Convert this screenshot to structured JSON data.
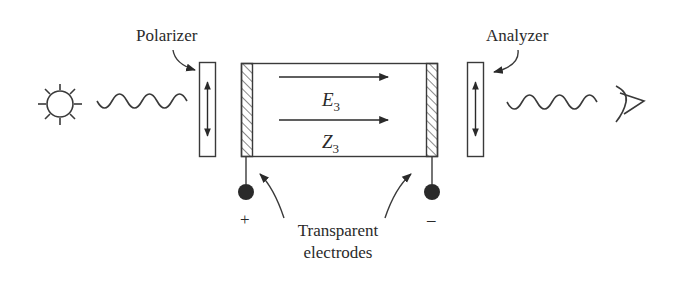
{
  "diagram": {
    "labels": {
      "polarizer": "Polarizer",
      "analyzer": "Analyzer",
      "field_symbol": "E",
      "field_subscript": "3",
      "axis_symbol": "Z",
      "axis_subscript": "3",
      "electrodes_line1": "Transparent",
      "electrodes_line2": "electrodes",
      "terminal_positive": "+",
      "terminal_negative": "–"
    },
    "components": [
      {
        "id": "light-source",
        "icon": "sun-icon"
      },
      {
        "id": "input-wave",
        "icon": "wave-icon"
      },
      {
        "id": "polarizer",
        "icon": "vertical-double-arrow-icon"
      },
      {
        "id": "crystal-cell",
        "icon": "rectangle"
      },
      {
        "id": "analyzer",
        "icon": "vertical-double-arrow-icon"
      },
      {
        "id": "output-wave",
        "icon": "wave-icon"
      },
      {
        "id": "observer",
        "icon": "eye-icon"
      }
    ],
    "colors": {
      "line": "#3a3a3a",
      "text": "#2a2a2a",
      "background": "#ffffff"
    }
  }
}
